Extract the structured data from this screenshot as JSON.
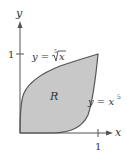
{
  "diagram": {
    "axes": {
      "x_label": "x",
      "y_label": "y",
      "x_tick_label": "1",
      "y_tick_label": "1"
    },
    "curves": [
      {
        "name": "fifth-root",
        "label_lhs": "y = ",
        "label_index": "5",
        "label_radicand": "x"
      },
      {
        "name": "fifth-power",
        "label_lhs": "y = x",
        "label_exp": "5"
      }
    ],
    "region": {
      "label": "R",
      "fill": "#c8c8c8"
    },
    "colors": {
      "stroke": "#555555",
      "text": "#333333"
    }
  }
}
